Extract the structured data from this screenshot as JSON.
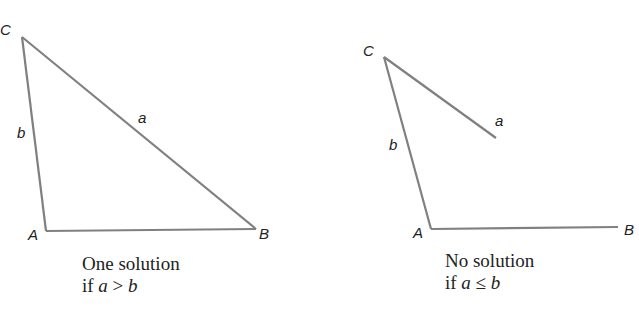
{
  "colors": {
    "line": "#808080",
    "text": "#222222",
    "background": "#ffffff"
  },
  "left_figure": {
    "vertices": {
      "C": "C",
      "A": "A",
      "B": "B"
    },
    "sides": {
      "a": "a",
      "b": "b"
    },
    "caption": {
      "line1": "One solution",
      "line2_prefix": "if ",
      "var1": "a",
      "op": " > ",
      "var2": "b"
    }
  },
  "right_figure": {
    "vertices": {
      "C": "C",
      "A": "A",
      "B": "B"
    },
    "sides": {
      "a": "a",
      "b": "b"
    },
    "caption": {
      "line1": "No solution",
      "line2_prefix": "if ",
      "var1": "a",
      "op": " ≤ ",
      "var2": "b"
    }
  }
}
